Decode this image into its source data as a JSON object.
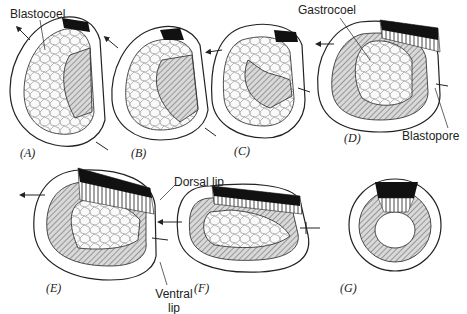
{
  "diagram": {
    "panels": [
      {
        "id": "A",
        "label": "(A)"
      },
      {
        "id": "B",
        "label": "(B)"
      },
      {
        "id": "C",
        "label": "(C)"
      },
      {
        "id": "D",
        "label": "(D)"
      },
      {
        "id": "E",
        "label": "(E)"
      },
      {
        "id": "F",
        "label": "(F)"
      },
      {
        "id": "G",
        "label": "(G)"
      }
    ],
    "annotations": {
      "blastocoel": "Blastocoel",
      "gastrocoel": "Gastrocoel",
      "blastopore": "Blastopore",
      "dorsal_lip": "Dorsal lip",
      "ventral_lip_line1": "Ventral",
      "ventral_lip_line2": "lip"
    },
    "colors": {
      "outline": "#222222",
      "ectoderm_fill": "#ffffff",
      "mesoderm_fill": "#bdbdbd",
      "endoderm_fill": "#f2f2f2",
      "dark_cap": "#111111"
    }
  }
}
